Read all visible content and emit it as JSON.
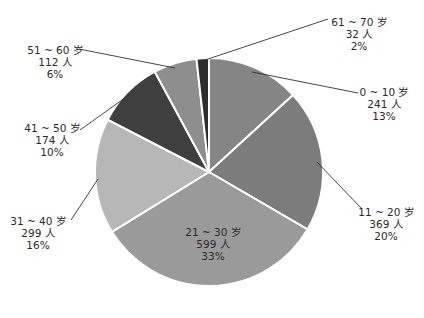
{
  "chart_data": {
    "type": "pie",
    "title": "",
    "start_angle_deg": 0,
    "direction": "clockwise",
    "center": [
      209,
      172
    ],
    "radius": 114,
    "unit_count": "人",
    "total": 1826,
    "slices": [
      {
        "label": "0 ~ 10 岁",
        "count": 241,
        "count_text": "241 人",
        "percent": 13,
        "percent_text": "13%",
        "color": "#858585",
        "label_pos": [
          384,
          86
        ],
        "leader": [
          [
            358,
            93
          ],
          [
            252,
            72
          ]
        ]
      },
      {
        "label": "11 ~ 20 岁",
        "count": 369,
        "count_text": "369 人",
        "percent": 20,
        "percent_text": "20%",
        "color": "#7c7c7c",
        "label_pos": [
          386,
          206
        ],
        "leader": [
          [
            361,
            208
          ],
          [
            317,
            162
          ]
        ]
      },
      {
        "label": "21 ~ 30 岁",
        "count": 599,
        "count_text": "599 人",
        "percent": 33,
        "percent_text": "33%",
        "color": "#9a9a9a",
        "label_pos": [
          213,
          226
        ],
        "leader": null
      },
      {
        "label": "31 ~ 40 岁",
        "count": 299,
        "count_text": "299 人",
        "percent": 16,
        "percent_text": "16%",
        "color": "#b7b7b7",
        "label_pos": [
          38,
          215
        ],
        "leader": [
          [
            71,
            220
          ],
          [
            98,
            179
          ]
        ]
      },
      {
        "label": "41 ~ 50 岁",
        "count": 174,
        "count_text": "174 人",
        "percent": 10,
        "percent_text": "10%",
        "color": "#3f3f3f",
        "label_pos": [
          52,
          122
        ],
        "leader": [
          [
            80,
            130
          ],
          [
            129,
            95
          ]
        ]
      },
      {
        "label": "51 ~ 60 岁",
        "count": 112,
        "count_text": "112 人",
        "percent": 6,
        "percent_text": "6%",
        "color": "#8e8e8e",
        "label_pos": [
          55,
          44
        ],
        "leader": [
          [
            79,
            49
          ],
          [
            175,
            68
          ]
        ]
      },
      {
        "label": "61 ~ 70 岁",
        "count": 32,
        "count_text": "32 人",
        "percent": 2,
        "percent_text": "2%",
        "color": "#2d2d2d",
        "label_pos": [
          359,
          16
        ],
        "leader": [
          [
            328,
            19
          ],
          [
            205,
            60
          ]
        ]
      }
    ],
    "legend": null,
    "separator_color": "#ffffff"
  }
}
